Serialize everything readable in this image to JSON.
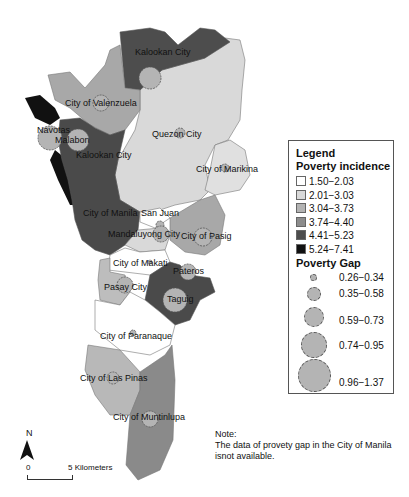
{
  "legend": {
    "title": "Legend",
    "incidence_title": "Poverty incidence",
    "incidence_classes": [
      {
        "range": "1.50−2.03",
        "color": "#ffffff"
      },
      {
        "range": "2.01−3.03",
        "color": "#d9d9d9"
      },
      {
        "range": "3.04−3.73",
        "color": "#b3b3b3"
      },
      {
        "range": "3.74−4.40",
        "color": "#8c8c8c"
      },
      {
        "range": "4.41−5.23",
        "color": "#4d4d4d"
      },
      {
        "range": "5.24−7.41",
        "color": "#111111"
      }
    ],
    "gap_title": "Poverty Gap",
    "gap_classes": [
      {
        "range": "0.26−0.34",
        "size": 7
      },
      {
        "range": "0.35−0.58",
        "size": 14
      },
      {
        "range": "0.59−0.73",
        "size": 20
      },
      {
        "range": "0.74−0.95",
        "size": 26
      },
      {
        "range": "0.96−1.37",
        "size": 33
      }
    ]
  },
  "cities": [
    {
      "name": "Kalookan City",
      "x": 135,
      "y": 23
    },
    {
      "name": "City of Valenzuela",
      "x": 65,
      "y": 104
    },
    {
      "name": "Navotas",
      "x": 37,
      "y": 132
    },
    {
      "name": "Malabon",
      "x": 55,
      "y": 143
    },
    {
      "name": "Kalookan City",
      "x": 76,
      "y": 158
    },
    {
      "name": "Quezon City",
      "x": 152,
      "y": 136
    },
    {
      "name": "City of Marikina",
      "x": 196,
      "y": 171
    },
    {
      "name": "City of Manila",
      "x": 83,
      "y": 215
    },
    {
      "name": "San Juan",
      "x": 141,
      "y": 215
    },
    {
      "name": "Mandaluyong City",
      "x": 108,
      "y": 236
    },
    {
      "name": "City of Pasig",
      "x": 181,
      "y": 238
    },
    {
      "name": "City of Makati",
      "x": 113,
      "y": 266
    },
    {
      "name": "Pateros",
      "x": 173,
      "y": 274
    },
    {
      "name": "Pasay City",
      "x": 104,
      "y": 290
    },
    {
      "name": "Taguig",
      "x": 167,
      "y": 302
    },
    {
      "name": "City of Paranaque",
      "x": 100,
      "y": 339
    },
    {
      "name": "City of Las Pinas",
      "x": 80,
      "y": 381
    },
    {
      "name": "City of Muntinlupa",
      "x": 113,
      "y": 420
    }
  ],
  "north_label": "N",
  "scale": {
    "start": "0",
    "end": "5 Kilometers"
  },
  "note": {
    "title": "Note:",
    "text": "The data of provety gap in the City of Manila isnot available."
  }
}
